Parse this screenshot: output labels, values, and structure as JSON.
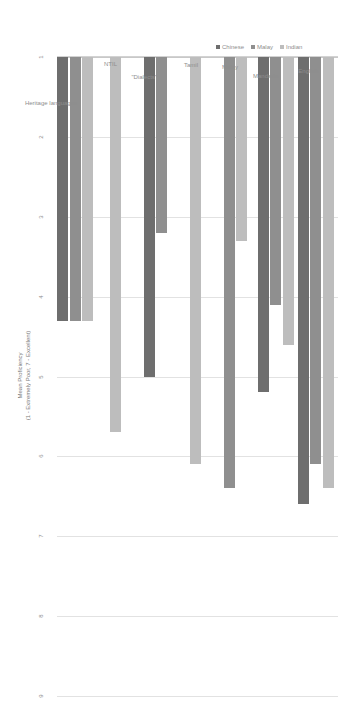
{
  "chart_data": {
    "type": "bar",
    "orientation": "horizontal",
    "title": "",
    "xlabel": "Mean Proficiency (1 - Extremely Poor, 7 - Excellent)",
    "ylabel": "",
    "categories": [
      "English",
      "Mandarin",
      "Malay",
      "Tamil",
      "\"Dialects\"",
      "NTIL",
      "Heritage languages"
    ],
    "series": [
      {
        "name": "Chinese",
        "color": "#6e6e6e",
        "values": [
          6.6,
          5.2,
          null,
          null,
          5.0,
          null,
          4.3
        ]
      },
      {
        "name": "Malay",
        "color": "#8f8f8f",
        "values": [
          6.1,
          4.1,
          6.4,
          null,
          3.2,
          null,
          4.3
        ]
      },
      {
        "name": "Indian",
        "color": "#bdbdbd",
        "values": [
          6.4,
          4.6,
          3.3,
          6.1,
          null,
          5.7,
          4.3
        ]
      }
    ],
    "xlim": [
      1,
      9
    ],
    "xticks": [
      1,
      2,
      3,
      4,
      5,
      6,
      7,
      8,
      9
    ],
    "xticklabels": [
      "1",
      "2",
      "3",
      "4",
      "5",
      "6",
      "7",
      "8",
      "9"
    ],
    "grid": true,
    "legend_position": "center",
    "axis_title_line1": "Mean Proficiency",
    "axis_title_line2": "(1 - Extremely Poor, 7 - Excellent)"
  },
  "legend": {
    "items": [
      {
        "label": "Chinese",
        "color": "#6e6e6e"
      },
      {
        "label": "Malay",
        "color": "#8f8f8f"
      },
      {
        "label": "Indian",
        "color": "#bdbdbd"
      }
    ]
  },
  "colors": {
    "background": "#ffffff",
    "gridline": "#e2e2e2",
    "axis": "#c8c8c8",
    "text": "#8e8e8e"
  }
}
